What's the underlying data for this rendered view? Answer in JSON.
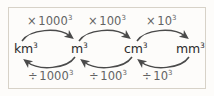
{
  "diagram": {
    "type": "unit-conversion-flow",
    "border_color": "#d7d2c8",
    "background_color": "#fdfcfa",
    "unit_text_color": "#2b2b2b",
    "label_text_color": "#636363",
    "arrow_color": "#4a4a4a",
    "units": [
      {
        "label": "km",
        "exponent": "3"
      },
      {
        "label": "m",
        "exponent": "3"
      },
      {
        "label": "cm",
        "exponent": "3"
      },
      {
        "label": "mm",
        "exponent": "3"
      }
    ],
    "top_operations": [
      {
        "symbol": "×",
        "operand": "1000",
        "exponent": "3",
        "from": "km³",
        "to": "m³",
        "direction": "left-to-right"
      },
      {
        "symbol": "×",
        "operand": "100",
        "exponent": "3",
        "from": "m³",
        "to": "cm³",
        "direction": "left-to-right"
      },
      {
        "symbol": "×",
        "operand": "10",
        "exponent": "3",
        "from": "cm³",
        "to": "mm³",
        "direction": "left-to-right"
      }
    ],
    "bottom_operations": [
      {
        "symbol": "÷",
        "operand": "1000",
        "exponent": "3",
        "from": "m³",
        "to": "km³",
        "direction": "right-to-left"
      },
      {
        "symbol": "÷",
        "operand": "100",
        "exponent": "3",
        "from": "cm³",
        "to": "m³",
        "direction": "right-to-left"
      },
      {
        "symbol": "÷",
        "operand": "10",
        "exponent": "3",
        "from": "mm³",
        "to": "cm³",
        "direction": "right-to-left"
      }
    ]
  }
}
